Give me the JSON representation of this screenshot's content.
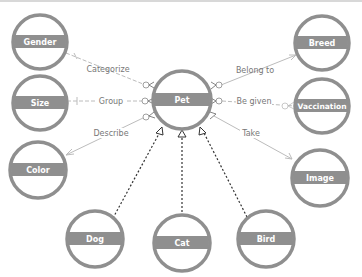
{
  "diagram": {
    "colors": {
      "node_stroke": "#8f8f8f",
      "node_band": "#8f8f8f",
      "node_fill": "#ffffff",
      "edge_line": "#bcbcbc",
      "inherit_line": "#333333",
      "edge_label": "#777777"
    },
    "nodes": {
      "pet": "Pet",
      "gender": "Gender",
      "size": "Size",
      "color": "Color",
      "breed": "Breed",
      "vaccination": "Vaccination",
      "image": "Image",
      "dog": "Dog",
      "cat": "Cat",
      "bird": "Bird"
    },
    "edges": {
      "categorize": "Categorize",
      "group": "Group",
      "describe": "Describe",
      "belong_to": "Belong to",
      "be_given": "Be given",
      "take": "Take"
    }
  }
}
